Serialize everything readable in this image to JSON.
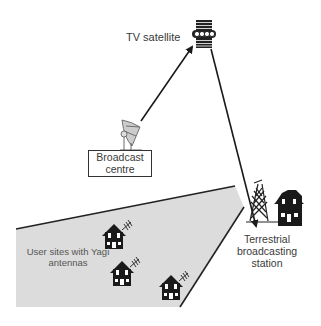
{
  "diagram": {
    "type": "satellite-and-terrestrial-broadcast",
    "nodes": [
      {
        "id": "satellite",
        "label": "TV satellite",
        "icon": "satellite-icon"
      },
      {
        "id": "broadcast_centre",
        "label": "Broadcast centre",
        "label_lines": [
          "Broadcast",
          "centre"
        ],
        "icon": "satellite-dish-icon"
      },
      {
        "id": "terrestrial_station",
        "label": "Terrestrial broadcasting station",
        "label_lines": [
          "Terrestrial",
          "broadcasting",
          "station"
        ],
        "icon": "transmission-tower-icon"
      },
      {
        "id": "user_sites",
        "label": "User sites with Yagi antennas",
        "label_lines": [
          "User sites with Yagi",
          "antennas"
        ],
        "icon": "house-with-antenna-icon",
        "count": 3
      }
    ],
    "edges": [
      {
        "from": "broadcast_centre",
        "to": "satellite",
        "style": "arrow"
      },
      {
        "from": "satellite",
        "to": "terrestrial_station",
        "style": "arrow"
      }
    ],
    "coverage_area": {
      "label": "User sites with Yagi antennas",
      "fill": "#dcdcdc",
      "stroke": "#222222"
    }
  },
  "labels": {
    "satellite": "TV satellite",
    "broadcast_centre_line1": "Broadcast",
    "broadcast_centre_line2": "centre",
    "users_line1": "User sites with Yagi",
    "users_line2": "antennas",
    "terrestrial_line1": "Terrestrial",
    "terrestrial_line2": "broadcasting",
    "terrestrial_line3": "station"
  },
  "colors": {
    "background": "#ffffff",
    "line": "#1a1a1a",
    "coverage_fill": "#dcdcdc",
    "text": "#3a3a3a"
  }
}
